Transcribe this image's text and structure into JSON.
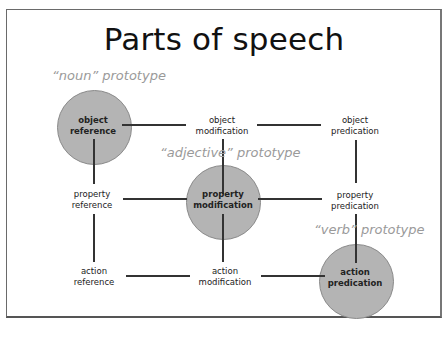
{
  "title": "Parts of speech",
  "prototypes": {
    "noun": "“noun” prototype",
    "adjective": "“adjective” prototype",
    "verb": "“verb” prototype"
  },
  "nodes": {
    "object_reference": [
      "object",
      "reference"
    ],
    "object_modification": [
      "object",
      "modification"
    ],
    "object_predication": [
      "object",
      "predication"
    ],
    "property_reference": [
      "property",
      "reference"
    ],
    "property_modification": [
      "property",
      "modification"
    ],
    "property_predication": [
      "property",
      "predication"
    ],
    "action_reference": [
      "action",
      "reference"
    ],
    "action_modification": [
      "action",
      "modification"
    ],
    "action_predication": [
      "action",
      "predication"
    ]
  },
  "colors": {
    "circle_fill": "#b4b4b4",
    "prototype_text": "#9a9a9a",
    "line": "#333333"
  }
}
